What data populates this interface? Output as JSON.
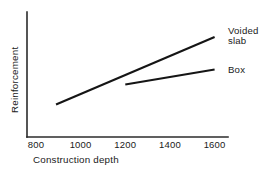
{
  "chart_data": {
    "type": "line",
    "title": "",
    "xlabel": "Construction depth",
    "ylabel": "Reinforcement",
    "xlim": [
      760,
      1660
    ],
    "ylim": [
      0,
      100
    ],
    "xticks": [
      800,
      1000,
      1200,
      1400,
      1600
    ],
    "xtick_labels": [
      "800",
      "1000",
      "1200",
      "1400",
      "1600"
    ],
    "yticks": [],
    "ytick_labels": [],
    "grid": false,
    "legend": "inline-end-labels",
    "series": [
      {
        "name": "Voided slab",
        "label_lines": [
          "Voided",
          "slab"
        ],
        "x": [
          890,
          1600
        ],
        "values": [
          26,
          80
        ]
      },
      {
        "name": "Box",
        "label_lines": [
          "Box"
        ],
        "x": [
          1200,
          1600
        ],
        "values": [
          42,
          54
        ]
      }
    ],
    "annotations": []
  },
  "colors": {
    "background": "#ffffff",
    "axis": "#2b2b2b",
    "line": "#151515",
    "text": "#1a1a1a"
  }
}
